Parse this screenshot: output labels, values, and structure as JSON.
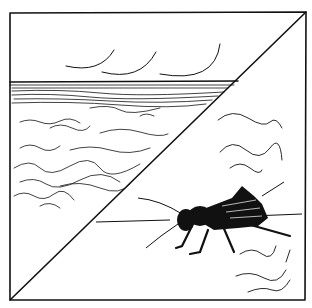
{
  "illustration": {
    "description": "Hand-drawn ink illustration in a square frame split by a diagonal line: top-left shows sea waves under a sky with curved strokes; bottom-right shows a black cricket with wind/motion strokes.",
    "panels": [
      {
        "name": "sea-panel",
        "content": "ocean horizon, choppy waves, sky with three curved strokes"
      },
      {
        "name": "cricket-panel",
        "content": "black cricket insect with long antennae, squiggly strokes around"
      }
    ],
    "colors": {
      "ink": "#111111",
      "paper": "#ffffff"
    }
  }
}
